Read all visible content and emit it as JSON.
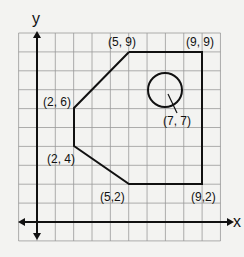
{
  "diagram": {
    "axes": {
      "x_label": "x",
      "y_label": "y"
    },
    "polygon_vertices": [
      [
        5,
        9
      ],
      [
        9,
        9
      ],
      [
        9,
        2
      ],
      [
        5,
        2
      ],
      [
        2,
        4
      ],
      [
        2,
        6
      ]
    ],
    "circle": {
      "center": [
        7,
        7
      ],
      "radius": 0.9
    },
    "labels": [
      {
        "text": "(5, 9)",
        "pos": [
          5,
          9
        ]
      },
      {
        "text": "(9, 9)",
        "pos": [
          9,
          9
        ]
      },
      {
        "text": "(2, 6)",
        "pos": [
          2,
          6
        ]
      },
      {
        "text": "(7, 7)",
        "pos": [
          7,
          7
        ]
      },
      {
        "text": "(2, 4)",
        "pos": [
          2,
          4
        ]
      },
      {
        "text": "(5,2)",
        "pos": [
          5,
          2
        ]
      },
      {
        "text": "(9,2)",
        "pos": [
          9,
          2
        ]
      }
    ],
    "grid": {
      "x_range": [
        -1,
        10
      ],
      "y_range": [
        -1,
        10
      ]
    }
  }
}
